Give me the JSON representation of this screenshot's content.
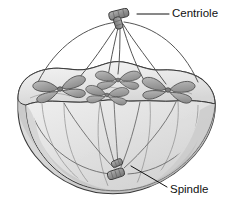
{
  "figure": {
    "type": "biology-illustration",
    "canvas": {
      "width": 231,
      "height": 203
    },
    "background_color": "#ffffff"
  },
  "colors": {
    "outline": "#3a3a3a",
    "cell_light": "#ececec",
    "cell_mid": "#dadada",
    "cell_dark": "#c2c2c2",
    "cell_shadow": "#b4b4b4",
    "chromosome_fill": "#a8a8a8",
    "chromosome_outline": "#4a4a4a",
    "centriole_fill": "#9a9a9a",
    "centriole_outline": "#3a3a3a",
    "fiber": "#555555",
    "label": "#111111",
    "leader": "#111111"
  },
  "labels": [
    {
      "id": "centriole",
      "text": "Centriole",
      "x": 172,
      "y": 14,
      "anchor": "start",
      "leader": {
        "x1": 138,
        "y1": 14,
        "x2": 169,
        "y2": 14
      }
    },
    {
      "id": "spindle",
      "text": "Spindle",
      "x": 170,
      "y": 190,
      "anchor": "start",
      "leader": {
        "x1": 131,
        "y1": 166,
        "x2": 167,
        "y2": 187
      }
    }
  ],
  "structures": {
    "cell": {
      "name": "cell-body",
      "description": "cut-away hemispherical cell with wavy equatorial rim"
    },
    "centriole_top": {
      "name": "centriole-top",
      "x": 119,
      "y": 16,
      "count": 2
    },
    "centriole_bottom": {
      "name": "centriole-bottom",
      "x": 118,
      "y": 171,
      "count": 2
    },
    "chromosomes": [
      {
        "id": "chromosome-left",
        "cx": 60,
        "cy": 89,
        "rot": -8,
        "scale": 1.0
      },
      {
        "id": "chromosome-center-upper",
        "cx": 118,
        "cy": 80,
        "rot": 0,
        "scale": 0.92
      },
      {
        "id": "chromosome-center-lower",
        "cx": 107,
        "cy": 95,
        "rot": 4,
        "scale": 0.88
      },
      {
        "id": "chromosome-right",
        "cx": 168,
        "cy": 90,
        "rot": 6,
        "scale": 1.0
      }
    ],
    "spindle_fibers": {
      "outer_arcs": 2,
      "upper_rays": 5,
      "interior_rays": 5
    }
  }
}
